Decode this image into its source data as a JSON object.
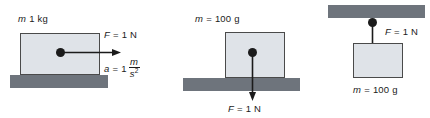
{
  "figure": {
    "background_color": "#ffffff",
    "block_fill_color": "#dfe3e8",
    "block_stroke_color": "#4a4a4a",
    "surface_color": "#6e747c",
    "marker_color": "#1b1b1b",
    "width": 430,
    "height": 118
  },
  "panels": [
    {
      "id": "panel-1",
      "name": "one-kilogram-block-on-ground-horizontal-force",
      "mass_label": "m = 1 kg",
      "mass_symbol": "m",
      "mass_value": "1 kg",
      "force_label": "F = 1 N",
      "force_symbol": "F",
      "force_value": "1 N",
      "acceleration_symbol": "a",
      "acceleration_label": "a = 1",
      "acceleration_value": "1",
      "acceleration_unit_numerator": "m",
      "acceleration_unit_denominator": "s",
      "acceleration_unit_exponent": "2",
      "force_direction": "right",
      "arrow_direction": "horizontal-right"
    },
    {
      "id": "panel-2",
      "name": "hundred-gram-block-on-ground-downward-force",
      "mass_label": "m = 100 g",
      "mass_symbol": "m",
      "mass_value": "100 g",
      "force_label": "F = 1 N",
      "force_symbol": "F",
      "force_value": "1 N",
      "force_direction": "down",
      "arrow_direction": "vertical-down"
    },
    {
      "id": "panel-3",
      "name": "hundred-gram-block-hanging-from-ceiling",
      "mass_label": "m = 100 g",
      "mass_symbol": "m",
      "mass_value": "100 g",
      "force_label": "F = 1 N",
      "force_symbol": "F",
      "force_value": "1 N",
      "force_direction": "down",
      "arrow_direction": "vertical-down"
    }
  ]
}
